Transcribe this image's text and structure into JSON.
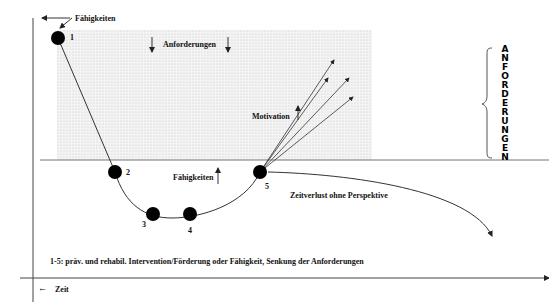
{
  "diagram": {
    "labels": {
      "top_left_ability": "Fähigkeiten",
      "demands_down": "Anforderungen",
      "motivation": "Motivation",
      "ability_up": "Fähigkeiten",
      "time_loss": "Zeitverlust ohne Perspektive",
      "time_axis": "Zeit",
      "vertical_demands": "ANFORDERUNGEN",
      "legend": "1-5: präv. und rehabil. Intervention/Förderung oder Fähigkeit, Senkung der Anforderungen"
    },
    "nodes": [
      {
        "id": "1",
        "label": "1"
      },
      {
        "id": "2",
        "label": "2"
      },
      {
        "id": "3",
        "label": "3"
      },
      {
        "id": "4",
        "label": "4"
      },
      {
        "id": "5",
        "label": "5"
      }
    ],
    "colors": {
      "shade": "#e4e4e4",
      "line": "#555555",
      "node": "#000000"
    }
  }
}
